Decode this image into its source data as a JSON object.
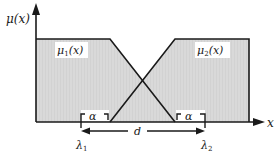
{
  "diagram": {
    "y_axis_label": "μ(x)",
    "x_axis_label": "x",
    "functions": [
      {
        "name": "μ1(x)",
        "base": "μ",
        "sub": "1",
        "arg": "(x)"
      },
      {
        "name": "μ2(x)",
        "base": "μ",
        "sub": "2",
        "arg": "(x)"
      }
    ],
    "markers": [
      {
        "name": "λ1",
        "base": "λ",
        "sub": "1"
      },
      {
        "name": "λ2",
        "base": "λ",
        "sub": "2"
      }
    ],
    "alpha_label": "α",
    "distance_label": "d",
    "colors": {
      "fill": "#d9d9d9",
      "stroke": "#1a1a1a",
      "background": "#ffffff"
    }
  }
}
